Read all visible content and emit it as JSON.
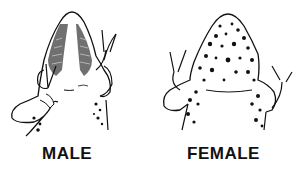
{
  "figures": [
    {
      "id": "male",
      "label": "MALE",
      "description": "Ventral view of frog throat, darkened (pigmented) throat region with striations, few spots on belly"
    },
    {
      "id": "female",
      "label": "FEMALE",
      "description": "Ventral view of frog throat, heavily spotted/mottled throat and belly, no dark vocal sac"
    }
  ],
  "colors": {
    "ink": "#111111",
    "background": "#ffffff"
  }
}
